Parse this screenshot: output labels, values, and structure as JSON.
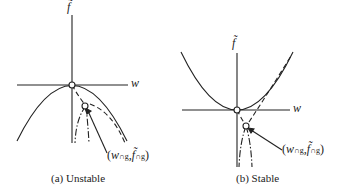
{
  "panels": [
    {
      "id": "a",
      "caption": "(a) Unstable",
      "y_axis_label": "f̃",
      "x_axis_label": "w",
      "point_label": {
        "open": "(",
        "w": "w",
        "w_sub": "∩g",
        "comma": ",",
        "f": "f̃",
        "f_sub": "∩g",
        "close": ")"
      }
    },
    {
      "id": "b",
      "caption": "(b) Stable",
      "y_axis_label": "f̃",
      "x_axis_label": "w",
      "point_label": {
        "open": "(",
        "w": "w",
        "w_sub": "∩g",
        "comma": ",",
        "f": "f̃",
        "f_sub": "∩g",
        "close": ")"
      }
    }
  ],
  "colors": {
    "stroke": "#222222",
    "background": "#ffffff"
  }
}
